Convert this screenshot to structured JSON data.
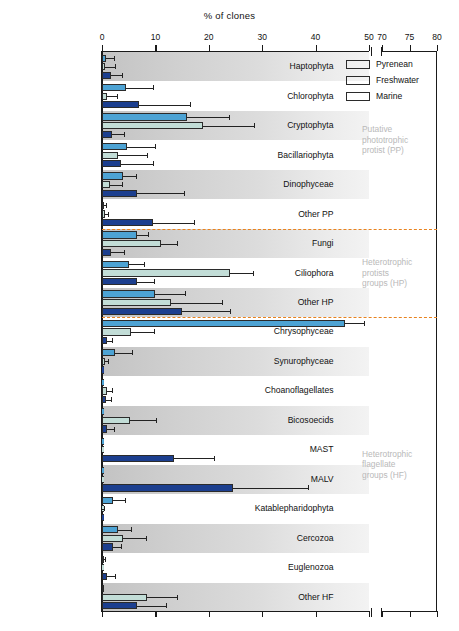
{
  "chart_data": {
    "type": "bar",
    "orientation": "horizontal",
    "title": "% of clones",
    "xlabel": "% of clones",
    "ylabel": "",
    "xlim": [
      0,
      80
    ],
    "axis_break": {
      "from": 50,
      "to": 70
    },
    "xticks": [
      0,
      10,
      20,
      30,
      40,
      50,
      70,
      75,
      80
    ],
    "grid": false,
    "legend_position": "top-right",
    "categories": [
      "Haptophyta",
      "Chlorophyta",
      "Cryptophyta",
      "Bacillariophyta",
      "Dinophyceae",
      "Other PP",
      "Fungi",
      "Ciliophora",
      "Other HP",
      "Chrysophyceae",
      "Synurophyceae",
      "Choanoflagellates",
      "Bicosoecids",
      "MAST",
      "MALV",
      "Katablepharidophyta",
      "Cercozoa",
      "Euglenozoa",
      "Other HF"
    ],
    "series": [
      {
        "name": "Pyrenean",
        "color": "#4da3d4",
        "values": [
          0.7,
          4.5,
          16.0,
          4.6,
          4.0,
          0.3,
          6.5,
          5.0,
          10.0,
          45.5,
          2.5,
          0.0,
          0.0,
          0.0,
          0.0,
          2.0,
          3.0,
          0.2,
          0.3
        ],
        "errors": [
          1.6,
          5.0,
          7.8,
          5.4,
          2.3,
          0.5,
          2.1,
          2.8,
          5.5,
          3.5,
          3.1,
          0.0,
          0.0,
          0.0,
          0.0,
          2.3,
          2.4,
          0.4,
          0.0
        ]
      },
      {
        "name": "Freshwater",
        "color": "#c2ddd7",
        "values": [
          0.5,
          1.0,
          19.0,
          3.0,
          1.5,
          0.5,
          11.0,
          24.0,
          13.0,
          5.5,
          0.5,
          0.9,
          5.2,
          0.0,
          0.0,
          0.0,
          4.0,
          0.0,
          8.5
        ],
        "errors": [
          1.9,
          1.8,
          9.5,
          5.5,
          2.2,
          0.6,
          3.0,
          4.2,
          9.5,
          4.2,
          0.6,
          1.0,
          5.0,
          0.0,
          0.0,
          0.4,
          4.2,
          0.0,
          5.5
        ]
      },
      {
        "name": "Marine",
        "color": "#1c3f8f",
        "values": [
          1.7,
          7.0,
          1.8,
          3.5,
          6.5,
          9.5,
          1.7,
          6.5,
          15.0,
          0.9,
          0.0,
          0.8,
          1.0,
          13.5,
          24.5,
          0.0,
          2.0,
          0.9,
          6.5
        ],
        "errors": [
          2.1,
          9.5,
          2.4,
          6.0,
          8.8,
          7.7,
          2.4,
          3.3,
          9.0,
          1.0,
          0.0,
          0.9,
          1.2,
          7.5,
          14.0,
          0.0,
          1.6,
          1.5,
          5.5
        ]
      }
    ],
    "annotations": [
      {
        "id": "pp",
        "text": "Putative\nphototrophic\nprotist (PP)",
        "after_category": "Other PP"
      },
      {
        "id": "hp",
        "text": "Heterotrophic\nprotists\ngroups (HP)",
        "after_category": "Other HP"
      },
      {
        "id": "hf",
        "text": "Heterotrophic\nflagellate\ngroups (HF)",
        "after_category": "Other HF"
      }
    ],
    "separator_color": "#e8821e"
  },
  "legend": {
    "items": [
      {
        "label": "Pyrenean"
      },
      {
        "label": "Freshwater"
      },
      {
        "label": "Marine"
      }
    ]
  }
}
